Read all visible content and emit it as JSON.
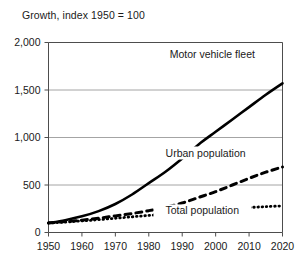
{
  "chart_data": {
    "type": "line",
    "title": "Growth, index 1950 = 100",
    "xlabel": "",
    "ylabel": "",
    "xlim": [
      1950,
      2020
    ],
    "ylim": [
      0,
      2000
    ],
    "xticks": [
      1950,
      1960,
      1970,
      1980,
      1990,
      2000,
      2010,
      2020
    ],
    "xtick_labels": [
      "1950",
      "1960",
      "1970",
      "1980",
      "1990",
      "2000",
      "2010",
      "2020"
    ],
    "yticks": [
      0,
      500,
      1000,
      1500,
      2000
    ],
    "ytick_labels": [
      "0",
      "500",
      "1,000",
      "1,500",
      "2,000"
    ],
    "grid": "horizontal",
    "legend": "inline-labels",
    "x": [
      1950,
      1955,
      1960,
      1965,
      1970,
      1975,
      1980,
      1985,
      1990,
      1995,
      2000,
      2005,
      2010,
      2015,
      2020
    ],
    "series": [
      {
        "name": "Motor vehicle fleet",
        "style": "solid",
        "color": "#000000",
        "label_x": 1999,
        "label_y": 1840,
        "values": [
          100,
          130,
          170,
          225,
          300,
          400,
          520,
          640,
          780,
          930,
          1060,
          1190,
          1320,
          1450,
          1570
        ]
      },
      {
        "name": "Urban population",
        "style": "dashed",
        "color": "#000000",
        "label_x": 1997,
        "label_y": 800,
        "values": [
          100,
          115,
          130,
          150,
          175,
          200,
          230,
          265,
          310,
          370,
          430,
          500,
          570,
          635,
          690
        ]
      },
      {
        "name": "Total population",
        "style": "dotted",
        "color": "#000000",
        "label_x": 1996,
        "label_y": 190,
        "values": [
          100,
          110,
          122,
          135,
          150,
          165,
          180,
          195,
          210,
          225,
          240,
          252,
          263,
          272,
          280
        ]
      }
    ]
  }
}
